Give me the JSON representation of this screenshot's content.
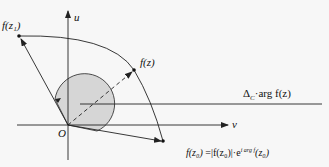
{
  "diagram": {
    "axes": {
      "u_label": "u",
      "v_label": "v",
      "origin_label": "O"
    },
    "points": {
      "f_z1": "f(z₁)",
      "f_z": "f(z)",
      "f_z0": "f(z₀)"
    },
    "annotations": {
      "delta_arg": "ΔC arg f(z)",
      "delta_symbol": "Δ",
      "delta_sub": "C",
      "delta_rest": "·arg f(z)",
      "polar_form": "f(z₀) = |f(z₀)|·e^(i arg f(z₀))",
      "polar_lhs": "f(z₀)",
      "polar_eq": " =|f(z₀)|·e",
      "polar_exp": "i arg f",
      "polar_tail": "(z₀)"
    },
    "colors": {
      "line": "#222222",
      "shade": "#d6d6d6",
      "background": "#f7f7f7"
    }
  }
}
